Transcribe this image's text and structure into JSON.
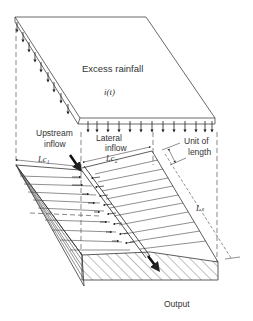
{
  "diagram": {
    "type": "overland-flow-catchment-schematic",
    "labels": {
      "excess_rainfall": "Excess rainfall",
      "rainfall_function": "i(t)",
      "upstream_inflow_1": "Upstream",
      "upstream_inflow_2": "inflow",
      "lateral_inflow_1": "Lateral",
      "lateral_inflow_2": "inflow",
      "lc1": "Lc₁",
      "lc2": "Lc₂",
      "unit_of_length_1": "Unit of",
      "unit_of_length_2": "length",
      "ls": "Lₛ",
      "output": "Output"
    },
    "colors": {
      "line": "#333333",
      "background": "#ffffff"
    }
  }
}
